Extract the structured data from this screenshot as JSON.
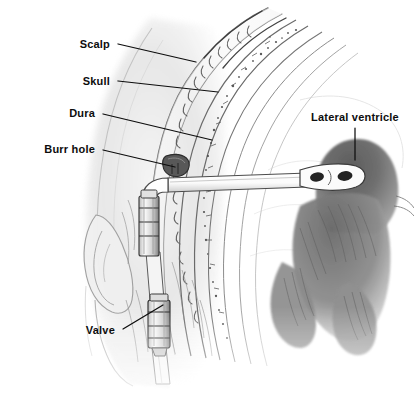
{
  "figure": {
    "medium": "pencil-illustration",
    "background_color": "#ffffff",
    "ink_color": "#0d0d0d",
    "width": 414,
    "height": 394
  },
  "labels": [
    {
      "id": "scalp",
      "text": "Scalp",
      "align": "right",
      "x": 110,
      "y": 44,
      "leader": {
        "type": "line",
        "x1": 118,
        "y1": 44,
        "x2": 196,
        "y2": 62
      }
    },
    {
      "id": "skull",
      "text": "Skull",
      "align": "right",
      "x": 110,
      "y": 81,
      "leader": {
        "type": "line",
        "x1": 118,
        "y1": 81,
        "x2": 218,
        "y2": 92
      }
    },
    {
      "id": "dura",
      "text": "Dura",
      "align": "right",
      "x": 95,
      "y": 113,
      "leader": {
        "type": "line",
        "x1": 103,
        "y1": 114,
        "x2": 212,
        "y2": 140
      }
    },
    {
      "id": "burr-hole",
      "text": "Burr hole",
      "align": "right",
      "x": 95,
      "y": 149,
      "leader": {
        "type": "line",
        "x1": 103,
        "y1": 150,
        "x2": 175,
        "y2": 167
      }
    },
    {
      "id": "valve",
      "text": "Valve",
      "align": "right",
      "x": 115,
      "y": 330,
      "leader": {
        "type": "line",
        "x1": 123,
        "y1": 329,
        "x2": 163,
        "y2": 305
      }
    },
    {
      "id": "lateral-ventricle",
      "text": "Lateral ventricle",
      "align": "center",
      "x": 355,
      "y": 117,
      "leader": {
        "type": "line",
        "x1": 355,
        "y1": 128,
        "x2": 355,
        "y2": 160
      }
    }
  ],
  "structures": [
    {
      "id": "head-profile",
      "name": "Head and ear profile",
      "shading": "light-graphite"
    },
    {
      "id": "scalp-layer",
      "name": "Scalp with hair follicles",
      "shading": "medium-graphite"
    },
    {
      "id": "skull-layer",
      "name": "Skull with diploe stippling",
      "shading": "stippled"
    },
    {
      "id": "dura-layer",
      "name": "Dura mater arcs",
      "shading": "fine-line"
    },
    {
      "id": "burr-hole-opening",
      "name": "Burr hole in skull",
      "shading": "dark"
    },
    {
      "id": "ventricular-catheter",
      "name": "Ventricular catheter tube",
      "shading": "outlined-white"
    },
    {
      "id": "catheter-tip",
      "name": "Fenestrated catheter tip",
      "shading": "dark-slots"
    },
    {
      "id": "upper-connector",
      "name": "Upper connector / reservoir",
      "shading": "segmented-cylinder"
    },
    {
      "id": "valve-device",
      "name": "Shunt valve",
      "shading": "segmented-cylinder"
    },
    {
      "id": "distal-tubing",
      "name": "Distal subcutaneous tubing",
      "shading": "outlined"
    },
    {
      "id": "lateral-ventricle-mass",
      "name": "Lateral ventricle (brain)",
      "shading": "dark-graphite"
    }
  ]
}
